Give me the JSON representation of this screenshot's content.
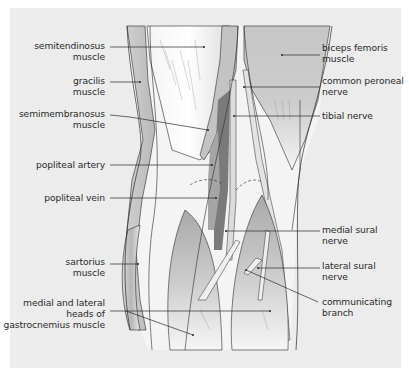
{
  "figure": {
    "background_color": "#ececec",
    "line_color": "#2a2a2a"
  },
  "labels_left": [
    {
      "id": "semitendinosus",
      "line1": "semitendinosus",
      "line2": "muscle"
    },
    {
      "id": "gracilis",
      "line1": "gracilis",
      "line2": "muscle"
    },
    {
      "id": "semimembranosus",
      "line1": "semimembranosus",
      "line2": "muscle"
    },
    {
      "id": "popliteal-artery",
      "line1": "popliteal artery",
      "line2": ""
    },
    {
      "id": "popliteal-vein",
      "line1": "popliteal vein",
      "line2": ""
    },
    {
      "id": "sartorius",
      "line1": "sartorius",
      "line2": "muscle"
    },
    {
      "id": "gastrocnemius",
      "line1": "medial and lateral",
      "line2": "heads of",
      "line3": "gastrocnemius muscle"
    }
  ],
  "labels_right": [
    {
      "id": "biceps-femoris",
      "line1": "biceps femoris",
      "line2": "muscle"
    },
    {
      "id": "common-peroneal",
      "line1": "common peroneal",
      "line2": "nerve"
    },
    {
      "id": "tibial-nerve",
      "line1": "tibial nerve",
      "line2": ""
    },
    {
      "id": "medial-sural",
      "line1": "medial sural",
      "line2": "nerve"
    },
    {
      "id": "lateral-sural",
      "line1": "lateral sural",
      "line2": "nerve"
    },
    {
      "id": "communicating-branch",
      "line1": "communicating",
      "line2": "branch"
    }
  ]
}
